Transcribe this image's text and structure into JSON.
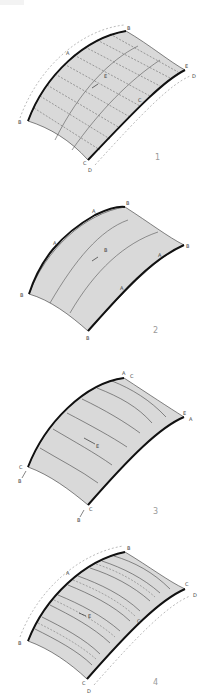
{
  "figure": {
    "colors": {
      "surface_fill": "#d9d9d9",
      "edge_stroke": "#111111",
      "grid_stroke": "#555555",
      "label": "#444444",
      "number": "#9a9a9a"
    },
    "panels": [
      {
        "number": "1",
        "labels": {
          "top_right": "B",
          "top_mid": "A",
          "left": "B",
          "right_upper": "E",
          "right_lower": "D",
          "right_mid": "C",
          "bottom_upper": "C",
          "bottom_lower": "D",
          "center": "E"
        }
      },
      {
        "number": "2",
        "labels": {
          "top_right": "B",
          "top_mid": "A",
          "left_mid": "A",
          "left": "B",
          "right": "B",
          "right_upper": "A",
          "right_mid": "A",
          "bottom": "B",
          "center": "B"
        }
      },
      {
        "number": "3",
        "labels": {
          "top_a": "A",
          "top_c": "C",
          "right_e": "E",
          "right_a": "A",
          "left_c": "C",
          "left_b": "B",
          "bottom_c": "C",
          "bottom_b": "B",
          "center": "E"
        }
      },
      {
        "number": "4",
        "labels": {
          "top_right": "B",
          "top_mid": "A",
          "left": "B",
          "right_upper": "C",
          "right_lower": "D",
          "right_mid": "C",
          "bottom_upper": "C",
          "bottom_lower": "D",
          "center": "E"
        }
      }
    ]
  }
}
